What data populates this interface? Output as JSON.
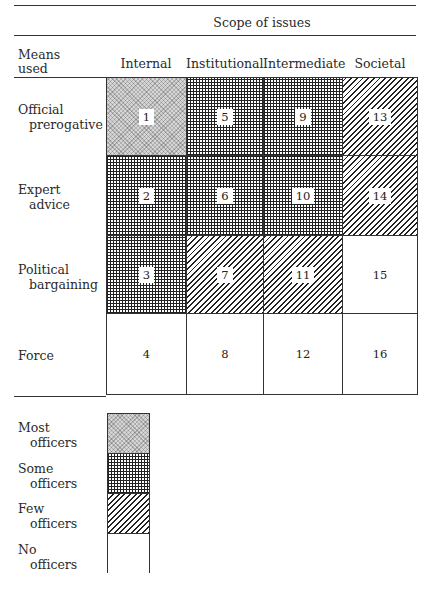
{
  "header": {
    "scope_title": "Scope of issues",
    "row_header": [
      "Means",
      "used"
    ],
    "columns": [
      "Internal",
      "Institutional",
      "Intermediate",
      "Societal"
    ]
  },
  "rows": [
    {
      "label": [
        "Official",
        "prerogative"
      ]
    },
    {
      "label": [
        "Expert",
        "advice"
      ]
    },
    {
      "label": [
        "Political",
        "bargaining"
      ]
    },
    {
      "label": [
        "Force",
        ""
      ]
    }
  ],
  "cells": [
    {
      "num": "1",
      "level": "most"
    },
    {
      "num": "2",
      "level": "some"
    },
    {
      "num": "3",
      "level": "some"
    },
    {
      "num": "4",
      "level": "none"
    },
    {
      "num": "5",
      "level": "some"
    },
    {
      "num": "6",
      "level": "some"
    },
    {
      "num": "7",
      "level": "few"
    },
    {
      "num": "8",
      "level": "none"
    },
    {
      "num": "9",
      "level": "some"
    },
    {
      "num": "10",
      "level": "some"
    },
    {
      "num": "11",
      "level": "few"
    },
    {
      "num": "12",
      "level": "none"
    },
    {
      "num": "13",
      "level": "few"
    },
    {
      "num": "14",
      "level": "few"
    },
    {
      "num": "15",
      "level": "none"
    },
    {
      "num": "16",
      "level": "none"
    }
  ],
  "legend": [
    {
      "level": "most",
      "label": [
        "Most",
        "officers"
      ]
    },
    {
      "level": "some",
      "label": [
        "Some",
        "officers"
      ]
    },
    {
      "level": "few",
      "label": [
        "Few",
        "officers"
      ]
    },
    {
      "level": "none",
      "label": [
        "No",
        "officers"
      ]
    }
  ]
}
